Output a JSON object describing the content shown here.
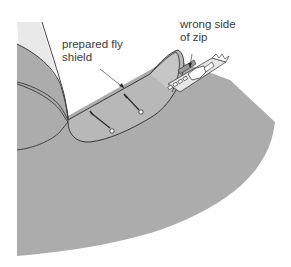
{
  "figure": {
    "labels": {
      "fly_shield_line1": "prepared fly",
      "fly_shield_line2": "shield",
      "zip_line1": "wrong side",
      "zip_line2": "of zip"
    },
    "colors": {
      "fabric": "#acacac",
      "fabric_light": "#bdbdbd",
      "outline": "#2a2a2a",
      "zip_tape": "#e6e6e6",
      "background": "#ffffff",
      "text": "#3a3a3a"
    }
  }
}
